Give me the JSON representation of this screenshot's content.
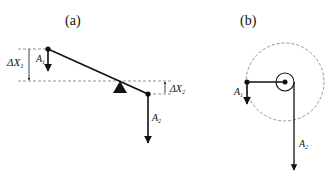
{
  "panels": {
    "a": {
      "label": "(a)",
      "delta_x1": {
        "symbol": "ΔX",
        "sub": "1"
      },
      "delta_x2": {
        "symbol": "ΔX",
        "sub": "2"
      },
      "a1": {
        "symbol": "A",
        "sub": "1"
      },
      "a2": {
        "symbol": "A",
        "sub": "2"
      }
    },
    "b": {
      "label": "(b)",
      "a1": {
        "symbol": "A",
        "sub": "1"
      },
      "a2": {
        "symbol": "A",
        "sub": "2"
      }
    }
  },
  "colors": {
    "line": "#111111",
    "dashed": "#777777"
  }
}
